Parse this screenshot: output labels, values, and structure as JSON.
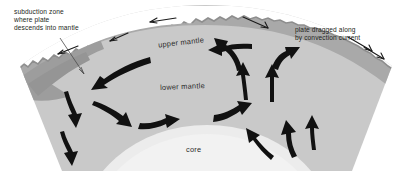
{
  "figure": {
    "type": "cross-section-diagram",
    "background_color": "#ffffff"
  },
  "layers": {
    "crust": {
      "name": "crust",
      "color": "#9a9a9a"
    },
    "upper_mantle": {
      "label": "upper mantle",
      "color": "#a9a9a9"
    },
    "lower_mantle": {
      "label": "lower mantle",
      "color": "#c9c9c9"
    },
    "core": {
      "label": "core",
      "color": "#ececec"
    }
  },
  "callouts": {
    "subduction": {
      "lines": [
        "subduction zone",
        "where plate",
        "descends into mantle"
      ],
      "line1": "subduction zone",
      "line2": "where plate",
      "line3": "descends into mantle"
    },
    "plate_drag": {
      "lines": [
        "plate dragged along",
        "by convection current"
      ],
      "line1": "plate dragged along",
      "line2": "by convection current"
    }
  },
  "icons": {
    "leader_line": "leader-line",
    "convection_arrow": "arrow-icon",
    "plate_motion_arrow": "arrow-icon"
  },
  "arrows": {
    "surface_plate_motion": [
      {
        "name": "surface-arrow-left-outer",
        "direction": "left-down",
        "weight": "thin"
      },
      {
        "name": "surface-arrow-left-inner",
        "direction": "left-down",
        "weight": "thin"
      },
      {
        "name": "surface-arrow-crest-left",
        "direction": "left",
        "weight": "thin"
      },
      {
        "name": "surface-arrow-crest-right",
        "direction": "right-down",
        "weight": "thin"
      },
      {
        "name": "surface-arrow-right-outer",
        "direction": "right-down",
        "weight": "thin"
      }
    ],
    "mantle_convection": [
      {
        "name": "subduction-descent-arrow",
        "direction": "down-left",
        "weight": "heavy"
      },
      {
        "name": "upper-mantle-return-arrow",
        "direction": "left",
        "weight": "heavy"
      },
      {
        "name": "descending-limb-arrow-1",
        "direction": "down",
        "weight": "heavy"
      },
      {
        "name": "descending-limb-arrow-2",
        "direction": "down",
        "weight": "heavy"
      },
      {
        "name": "basal-flow-arrow-1",
        "direction": "right-down",
        "weight": "heavy"
      },
      {
        "name": "basal-flow-arrow-2",
        "direction": "right-up",
        "weight": "heavy"
      },
      {
        "name": "basal-flow-arrow-3",
        "direction": "right-up",
        "weight": "heavy"
      },
      {
        "name": "upwelling-arrow-left",
        "direction": "up",
        "weight": "heavy"
      },
      {
        "name": "upwelling-arrow-right",
        "direction": "up",
        "weight": "heavy"
      },
      {
        "name": "divergence-arrow-left",
        "direction": "up-left-curved",
        "weight": "heavy"
      },
      {
        "name": "divergence-arrow-right",
        "direction": "up-right-curved",
        "weight": "heavy"
      },
      {
        "name": "right-flank-arrow-1",
        "direction": "up",
        "weight": "heavy"
      },
      {
        "name": "right-flank-arrow-2",
        "direction": "up-left",
        "weight": "heavy"
      },
      {
        "name": "right-flank-arrow-3",
        "direction": "up-left",
        "weight": "heavy"
      }
    ]
  }
}
